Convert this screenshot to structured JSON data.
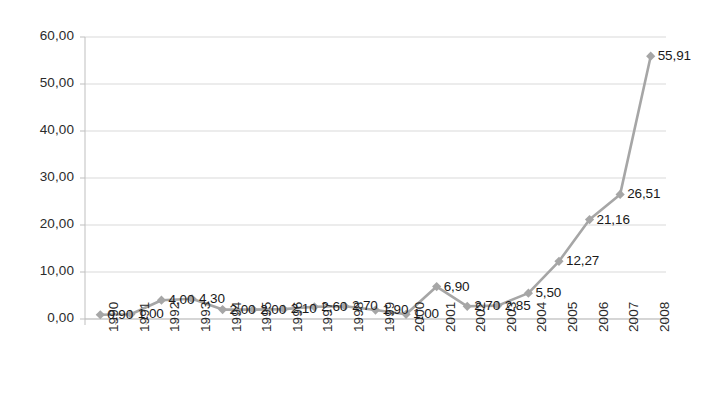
{
  "chart_data": {
    "type": "line",
    "title": "",
    "subtitle": "",
    "xlabel": "",
    "ylabel": "",
    "categories": [
      "1990",
      "1991",
      "1992",
      "1993",
      "1994",
      "1995",
      "1996",
      "1997",
      "1998",
      "1999",
      "2000",
      "2001",
      "2002",
      "2003",
      "2004",
      "2005",
      "2006",
      "2007",
      "2008"
    ],
    "values": [
      0.9,
      1.0,
      4.0,
      4.3,
      2.0,
      2.0,
      2.1,
      2.6,
      2.7,
      1.9,
      1.0,
      6.9,
      2.7,
      2.85,
      5.5,
      12.27,
      21.16,
      26.51,
      55.91
    ],
    "point_labels": [
      "0,90",
      "1,00",
      "4,00",
      "4,30",
      "2,00",
      "2,00",
      "2,10",
      "2,60",
      "2,70",
      "1,90",
      "1,00",
      "6,90",
      "2,70",
      "2,85",
      "5,50",
      "12,27",
      "21,16",
      "26,51",
      "55,91"
    ],
    "ylim": [
      0,
      60
    ],
    "ytick_values": [
      0,
      10,
      20,
      30,
      40,
      50,
      60
    ],
    "ytick_labels": [
      "0,00",
      "10,00",
      "20,00",
      "30,00",
      "40,00",
      "50,00",
      "60,00"
    ],
    "grid": "horizontal",
    "legend": "none",
    "series": [
      {
        "name": "series-1",
        "values": [
          0.9,
          1.0,
          4.0,
          4.3,
          2.0,
          2.0,
          2.1,
          2.6,
          2.7,
          1.9,
          1.0,
          6.9,
          2.7,
          2.85,
          5.5,
          12.27,
          21.16,
          26.51,
          55.91
        ],
        "line_color": "#a6a6a6",
        "marker": "diamond",
        "marker_color": "#a6a6a6"
      }
    ],
    "colors": {
      "line": "#a6a6a6",
      "marker": "#a6a6a6",
      "gridline": "#d9d9d9",
      "axis": "#bfbfbf",
      "tick_text": "#2b2b2b",
      "label_text": "#1a1a1a",
      "background": "#ffffff"
    },
    "label_position": "right"
  }
}
